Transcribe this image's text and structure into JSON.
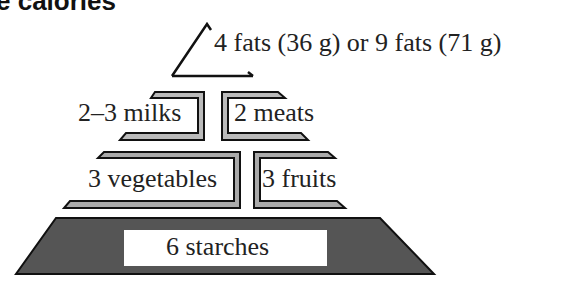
{
  "title": "e calories",
  "pyramid": {
    "apex": "4 fats (36 g) or 9 fats (71 g)",
    "tier2": [
      "2–3 milks",
      "2 meats"
    ],
    "tier3": [
      "3 vegetables",
      "3 fruits"
    ],
    "base": "6 starches"
  },
  "colors": {
    "line": "#111111",
    "shade": "#b8b8b8",
    "base_fill": "#555555"
  }
}
